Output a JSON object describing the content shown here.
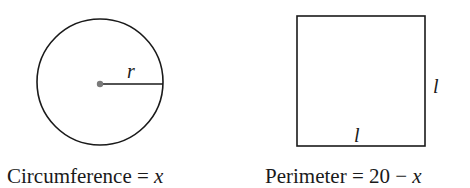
{
  "figure": {
    "circle": {
      "radius_label": "r",
      "caption_text": "Circumference = ",
      "caption_var": "x"
    },
    "square": {
      "side_label_right": "l",
      "side_label_bottom": "l",
      "caption_text": "Perimeter = 20 − ",
      "caption_var": "x"
    }
  },
  "colors": {
    "stroke": "#1a1a1a",
    "center_dot": "#7a7a7a",
    "background": "#ffffff"
  }
}
